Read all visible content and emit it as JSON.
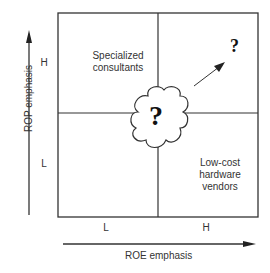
{
  "diagram": {
    "type": "2x2 matrix",
    "y_axis": {
      "label": "ROP emphasis",
      "ticks": [
        "H",
        "L"
      ]
    },
    "x_axis": {
      "label": "ROE emphasis",
      "ticks": [
        "L",
        "H"
      ]
    },
    "quadrants": {
      "top_left": {
        "label_line1": "Specialized",
        "label_line2": "consultants"
      },
      "top_right": {
        "symbol": "?"
      },
      "bottom_left": {
        "label": ""
      },
      "bottom_right": {
        "label_line1": "Low-cost",
        "label_line2": "hardware",
        "label_line3": "vendors"
      }
    },
    "center_cloud": {
      "symbol": "?"
    },
    "arrow": {
      "from": "center",
      "to": "top-right"
    },
    "colors": {
      "line": "#333333",
      "background": "#ffffff"
    }
  }
}
